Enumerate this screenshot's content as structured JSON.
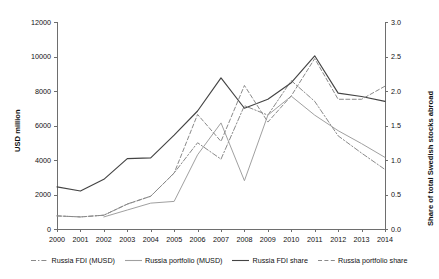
{
  "chart_data": {
    "type": "line",
    "title": "",
    "subtitle": "",
    "xlabel": "",
    "ylabel": "USD million",
    "ylabel_right": "Share of total Swedish stocks abroad",
    "grid": false,
    "legend_position": "bottom",
    "categories": [
      "2000",
      "2001",
      "2002",
      "2003",
      "2004",
      "2005",
      "2006",
      "2007",
      "2008",
      "2009",
      "2010",
      "2011",
      "2012",
      "2013",
      "2014"
    ],
    "ylim": [
      0,
      12000
    ],
    "yticks": [
      "0",
      "2000",
      "4000",
      "6000",
      "8000",
      "10000",
      "12000"
    ],
    "ylim_right": [
      0,
      3.0
    ],
    "yticks_right": [
      "0.0",
      "0.5",
      "1.0",
      "1.5",
      "2.0",
      "2.5",
      "3.0"
    ],
    "series": [
      {
        "name": "Russia FDI (MUSD)",
        "axis": "left",
        "style": "dash-dot",
        "color": "#8a8a8a",
        "values": [
          760,
          700,
          800,
          1450,
          1900,
          3250,
          5000,
          4050,
          7150,
          6600,
          8600,
          7400,
          5400,
          4400,
          3450
        ]
      },
      {
        "name": "Russia portfolio (MUSD)",
        "axis": "left",
        "style": "solid",
        "color": "#a0a0a0",
        "values": [
          null,
          null,
          700,
          1100,
          1500,
          1600,
          4300,
          6150,
          2800,
          6600,
          7700,
          6600,
          5700,
          4950,
          4150
        ]
      },
      {
        "name": "Russia FDI share",
        "axis": "right",
        "style": "solid",
        "color": "#444444",
        "values": [
          0.61,
          0.55,
          0.72,
          1.02,
          1.03,
          1.36,
          1.71,
          2.19,
          1.75,
          1.88,
          2.12,
          2.51,
          1.97,
          1.92,
          1.85
        ]
      },
      {
        "name": "Russia portfolio share",
        "axis": "right",
        "style": "dashed",
        "color": "#8a8a8a",
        "values": [
          0.19,
          0.175,
          0.2,
          0.36,
          0.475,
          0.81,
          1.66,
          1.27,
          2.08,
          1.55,
          1.93,
          2.47,
          1.88,
          1.88,
          2.07
        ]
      }
    ],
    "annotations": []
  },
  "legend": {
    "items": [
      {
        "label": "Russia FDI (MUSD)",
        "style": "dash-dot",
        "color": "#8a8a8a"
      },
      {
        "label": "Russia portfolio (MUSD)",
        "style": "solid",
        "color": "#a0a0a0"
      },
      {
        "label": "Russia FDI share",
        "style": "solid",
        "color": "#444444"
      },
      {
        "label": "Russia portfolio share",
        "style": "dashed",
        "color": "#8a8a8a"
      }
    ]
  }
}
